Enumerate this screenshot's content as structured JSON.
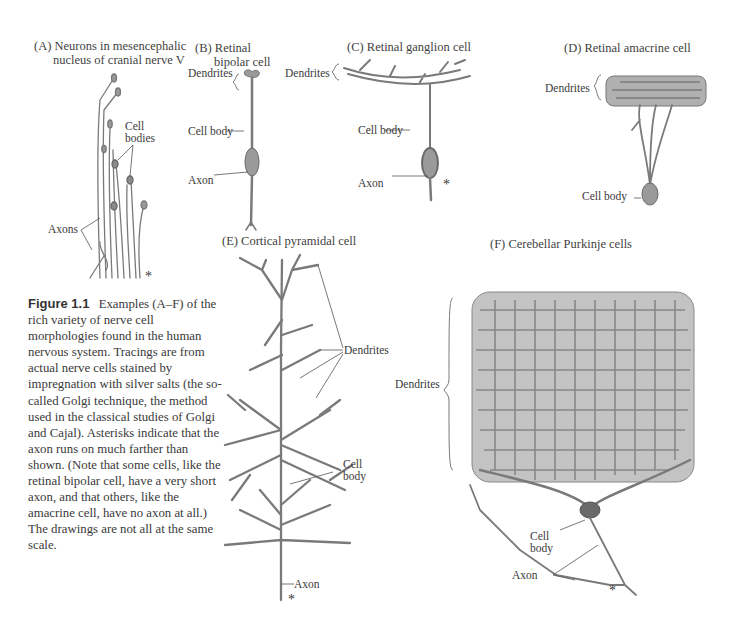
{
  "figure": {
    "number": "Figure 1.1",
    "caption": "Examples (A–F) of the rich variety of nerve cell morphologies found in the human nervous system. Tracings are from actual nerve cells stained by impregnation with silver salts (the so-called Golgi technique, the method used in the classical studies of Golgi and Cajal). Asterisks indicate that the axon runs on much farther than shown. (Note that some cells, like the retinal bipolar cell, have a very short axon, and that others, like the amacrine cell, have no axon at all.) The drawings are not all at the same scale."
  },
  "panels": [
    {
      "id": "A",
      "title_line1": "(A) Neurons in mesencephalic",
      "title_line2": "nucleus of cranial nerve V",
      "labels": {
        "cell_bodies_1": "Cell",
        "cell_bodies_2": "bodies",
        "axons": "Axons",
        "asterisk": "*"
      }
    },
    {
      "id": "B",
      "title_line1": "(B) Retinal",
      "title_line2": "bipolar cell",
      "labels": {
        "dendrites": "Dendrites",
        "cell_body": "Cell body",
        "axon": "Axon"
      }
    },
    {
      "id": "C",
      "title_line1": "(C) Retinal ganglion cell",
      "labels": {
        "dendrites": "Dendrites",
        "cell_body": "Cell body",
        "axon": "Axon",
        "asterisk": "*"
      }
    },
    {
      "id": "D",
      "title_line1": "(D) Retinal amacrine cell",
      "labels": {
        "dendrites": "Dendrites",
        "cell_body": "Cell body"
      }
    },
    {
      "id": "E",
      "title_line1": "(E) Cortical pyramidal cell",
      "labels": {
        "dendrites": "Dendrites",
        "cell_body_1": "Cell",
        "cell_body_2": "body",
        "axon": "Axon",
        "asterisk": "*"
      }
    },
    {
      "id": "F",
      "title_line1": "(F) Cerebellar Purkinje cells",
      "labels": {
        "dendrites": "Dendrites",
        "cell_body_1": "Cell",
        "cell_body_2": "body",
        "axon": "Axon",
        "asterisk": "*"
      }
    }
  ]
}
